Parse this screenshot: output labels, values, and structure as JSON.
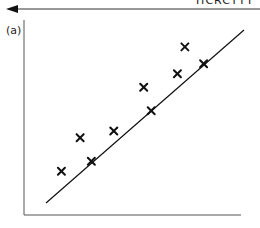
{
  "header": {
    "cut_off_text": "HCRCTYT",
    "arrow_direction": "left"
  },
  "panel": {
    "label": "(a)"
  },
  "chart_data": {
    "type": "scatter",
    "title": "",
    "xlabel": "",
    "ylabel": "",
    "grid": false,
    "legend": null,
    "marker": "x",
    "x": [
      1.0,
      1.5,
      1.8,
      2.4,
      3.2,
      3.4,
      4.1,
      4.3,
      4.8
    ],
    "y": [
      1.3,
      2.3,
      1.6,
      2.5,
      3.8,
      3.1,
      4.2,
      5.0,
      4.5
    ],
    "fit_line": {
      "x": [
        0.2,
        5.6
      ],
      "y": [
        0.4,
        5.5
      ]
    },
    "xlim": [
      0,
      5.8
    ],
    "ylim": [
      0,
      5.8
    ],
    "annotations": [
      "(a)"
    ]
  },
  "colors": {
    "ink": "#111111",
    "axis": "#555555",
    "background": "#ffffff"
  }
}
